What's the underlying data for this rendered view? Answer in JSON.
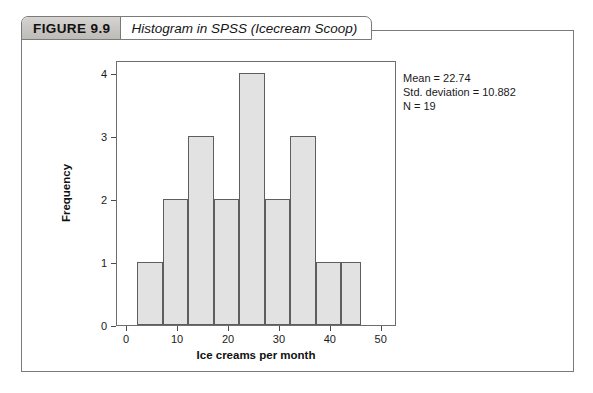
{
  "figure": {
    "number_label": "FIGURE 9.9",
    "title": "Histogram in SPSS (Icecream Scoop)"
  },
  "stats": {
    "mean_line": "Mean = 22.74",
    "std_line": "Std. deviation = 10.882",
    "n_line": "N = 19"
  },
  "chart_data": {
    "type": "bar",
    "title": "Histogram in SPSS (Icecream Scoop)",
    "xlabel": "Ice creams per month",
    "ylabel": "Frequency",
    "xlim": [
      -2,
      53
    ],
    "ylim": [
      0,
      4.2
    ],
    "xticks": [
      0,
      10,
      20,
      30,
      40,
      50
    ],
    "xtick_labels": [
      "0",
      "10",
      "20",
      "30",
      "40",
      "50"
    ],
    "yticks": [
      0,
      1,
      2,
      3,
      4
    ],
    "ytick_labels": [
      "0",
      "1",
      "2",
      "3",
      "4"
    ],
    "grid": false,
    "legend": false,
    "bin_width": 5,
    "bin_edges": [
      2,
      7,
      12,
      17,
      22,
      27,
      32,
      37,
      42,
      46
    ],
    "bins": [
      {
        "left": 2,
        "right": 7,
        "frequency": 1
      },
      {
        "left": 7,
        "right": 12,
        "frequency": 2
      },
      {
        "left": 12,
        "right": 17,
        "frequency": 3
      },
      {
        "left": 17,
        "right": 22,
        "frequency": 2
      },
      {
        "left": 22,
        "right": 27,
        "frequency": 4
      },
      {
        "left": 27,
        "right": 32,
        "frequency": 2
      },
      {
        "left": 32,
        "right": 37,
        "frequency": 3
      },
      {
        "left": 37,
        "right": 42,
        "frequency": 1
      },
      {
        "left": 42,
        "right": 46,
        "frequency": 1
      }
    ],
    "values": [
      1,
      2,
      3,
      2,
      4,
      2,
      3,
      1,
      1
    ],
    "total_count": 19,
    "statistics": {
      "mean": 22.74,
      "std_deviation": 10.882,
      "n": 19
    },
    "bar_fill_color": "#e2e2e2",
    "bar_edge_color": "#5e5e5e"
  }
}
